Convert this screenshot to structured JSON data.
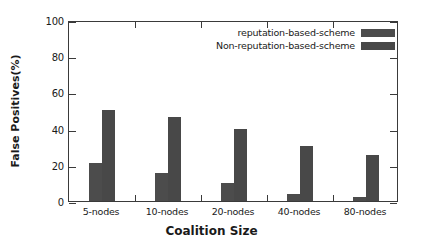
{
  "chart_data": {
    "type": "bar",
    "title": "",
    "xlabel": "Coalition Size",
    "ylabel": "False Positives(%)",
    "categories": [
      "5-nodes",
      "10-nodes",
      "20-nodes",
      "40-nodes",
      "80-nodes"
    ],
    "series": [
      {
        "name": "reputation-based-scheme",
        "values": [
          21,
          15.5,
          10,
          4,
          2
        ]
      },
      {
        "name": "Non-reputation-based-scheme",
        "values": [
          50.5,
          46.5,
          40,
          30.5,
          25.5
        ]
      }
    ],
    "ylim": [
      0,
      100
    ],
    "yticks": [
      0,
      20,
      40,
      60,
      80,
      100
    ],
    "ytick_labels": [
      "0",
      "20",
      "40",
      "60",
      "80",
      "100"
    ],
    "grid": false,
    "legend_position": "top-right",
    "colors": {
      "series_1": "#4c4c4c",
      "series_2": "#484848",
      "axis": "#3a3a3a",
      "background": "#ffffff"
    }
  }
}
